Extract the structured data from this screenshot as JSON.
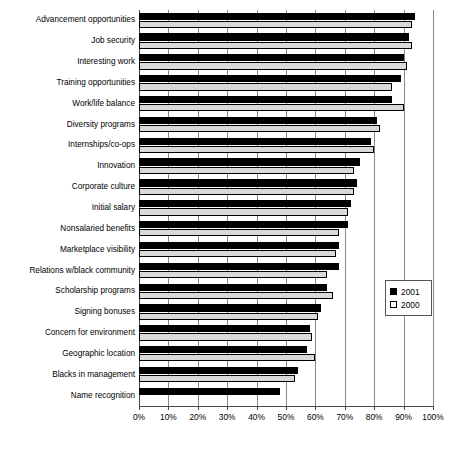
{
  "chart_data": {
    "type": "bar",
    "orientation": "horizontal",
    "title": "",
    "subtitle": "",
    "xlabel": "",
    "ylabel": "",
    "xlim": [
      0,
      100
    ],
    "xticks": [
      "0%",
      "10%",
      "20%",
      "30%",
      "40%",
      "50%",
      "60%",
      "70%",
      "80%",
      "90%",
      "100%"
    ],
    "xtick_values": [
      0,
      10,
      20,
      30,
      40,
      50,
      60,
      70,
      80,
      90,
      100
    ],
    "grid": "vertical",
    "legend_position": "right-middle",
    "categories": [
      "Advancement opportunities",
      "Job security",
      "Interesting work",
      "Training opportunities",
      "Work/life balance",
      "Diversity programs",
      "Internships/co-ops",
      "Innovation",
      "Corporate culture",
      "Initial salary",
      "Nonsalaried benefits",
      "Marketplace visibility",
      "Relations w/black community",
      "Scholarship programs",
      "Signing bonuses",
      "Concern for environment",
      "Geographic location",
      "Blacks in management",
      "Name recognition"
    ],
    "series": [
      {
        "name": "2001",
        "color": "#000000",
        "values": [
          94,
          92,
          90,
          89,
          86,
          81,
          79,
          75,
          74,
          72,
          71,
          68,
          68,
          64,
          62,
          58,
          57,
          54,
          48
        ]
      },
      {
        "name": "2000",
        "color": "#d9d9d9",
        "values": [
          93,
          93,
          91,
          86,
          90,
          82,
          80,
          73,
          73,
          71,
          68,
          67,
          64,
          66,
          61,
          59,
          60,
          53,
          null
        ]
      }
    ]
  },
  "legend": {
    "entries": [
      {
        "label": "2001",
        "swatch": "filled-black-square"
      },
      {
        "label": "2000",
        "swatch": "outline-white-square"
      }
    ]
  }
}
